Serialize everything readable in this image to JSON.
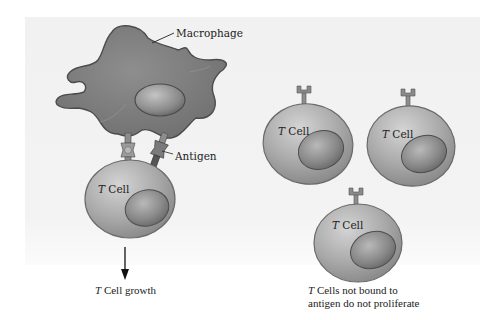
{
  "diagram": {
    "labels": {
      "macrophage": "Macrophage",
      "antigen": "Antigen",
      "t_cell_italic": "T",
      "t_cell_rest": " Cell",
      "growth_italic": "T",
      "growth_rest": " Cell growth",
      "not_bound_italic": "T",
      "not_bound_line1_rest": " Cells not bound to",
      "not_bound_line2": "antigen do not proliferate"
    },
    "nodes": [
      {
        "id": "macrophage",
        "type": "macrophage-cell"
      },
      {
        "id": "t-cell-bound",
        "type": "t-cell",
        "label": "T Cell",
        "bound_to_antigen": true
      },
      {
        "id": "t-cell-unbound-1",
        "type": "t-cell",
        "label": "T Cell",
        "bound_to_antigen": false
      },
      {
        "id": "t-cell-unbound-2",
        "type": "t-cell",
        "label": "T Cell",
        "bound_to_antigen": false
      },
      {
        "id": "t-cell-unbound-3",
        "type": "t-cell",
        "label": "T Cell",
        "bound_to_antigen": false
      }
    ],
    "edges": [
      {
        "from": "t-cell-bound",
        "to": "T Cell growth",
        "type": "arrow"
      }
    ],
    "colors": {
      "cell_fill": "#a8a8a8",
      "cell_edge": "#6a6a6a",
      "macrophage_fill": "#7d7d7d",
      "background_panel": "#f2f2f2"
    }
  }
}
